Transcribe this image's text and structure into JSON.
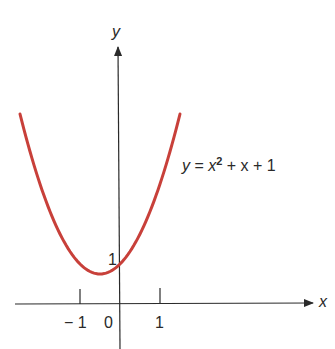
{
  "chart_data": {
    "type": "line",
    "title": "",
    "function": "y = x^2 + x + 1",
    "equation_label": {
      "y": "y",
      "eq": "=",
      "x": "x",
      "exp": "2",
      "rest": "+ x + 1"
    },
    "xlabel": "x",
    "ylabel": "y",
    "x_ticks": [
      -1,
      1
    ],
    "x_tick_labels": [
      "− 1",
      "0",
      "1"
    ],
    "y_tick_labels": [
      "1"
    ],
    "xlim": [
      -2.5,
      1.5
    ],
    "ylim": [
      0,
      4.75
    ],
    "vertex": {
      "x": -0.5,
      "y": 0.75
    },
    "y_intercept": 1,
    "grid": false,
    "series": [
      {
        "name": "y = x^2 + x + 1",
        "color": "#c8403a",
        "x": [
          -2.5,
          -2,
          -1.5,
          -1,
          -0.5,
          0,
          0.5,
          1,
          1.5
        ],
        "values": [
          4.75,
          3,
          1.75,
          1,
          0.75,
          1,
          1.75,
          3,
          4.75
        ]
      }
    ]
  },
  "labels": {
    "y_axis": "y",
    "x_axis": "x",
    "tick_neg1": "− 1",
    "tick_0": "0",
    "tick_1": "1",
    "y_tick_1": "1"
  },
  "colors": {
    "curve": "#c8403a",
    "axis": "#2a2a2a"
  }
}
